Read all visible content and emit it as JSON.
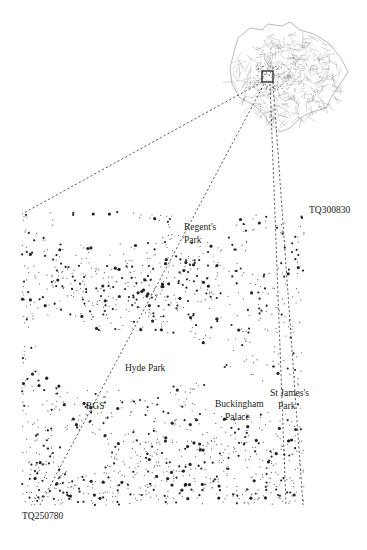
{
  "figure": {
    "type": "dot-density map"
  },
  "inset": {
    "name": "greater-london-wards",
    "highlight": "study-area-box"
  },
  "grid_refs": {
    "top_right": "TQ300830",
    "bottom_left": "TQ250780"
  },
  "places": [
    {
      "id": "regents-park",
      "lines": [
        "Regent's",
        "Park"
      ]
    },
    {
      "id": "hyde-park",
      "lines": [
        "Hyde Park"
      ]
    },
    {
      "id": "rgs",
      "lines": [
        "RGS"
      ]
    },
    {
      "id": "buckingham-palace",
      "lines": [
        "Buckingham",
        "Palace"
      ]
    },
    {
      "id": "st-james-park",
      "lines": [
        "St James's",
        "Park"
      ]
    }
  ],
  "colors": {
    "dots": "#1a1a1a",
    "background": "#ffffff",
    "ward_lines": "#8a8a8a"
  }
}
